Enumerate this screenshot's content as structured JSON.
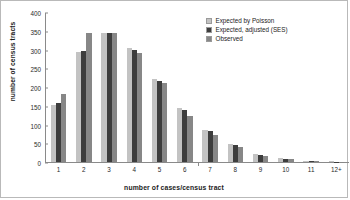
{
  "chart_data": {
    "type": "bar",
    "title": "",
    "xlabel": "number of cases/census tract",
    "ylabel": "number of census tracts",
    "categories": [
      "1",
      "2",
      "3",
      "4",
      "5",
      "6",
      "7",
      "8",
      "9",
      "10",
      "11",
      "12+"
    ],
    "ylim": [
      0,
      400
    ],
    "yticks": [
      0,
      50,
      100,
      150,
      200,
      250,
      300,
      350,
      400
    ],
    "grid": false,
    "legend_position": "top-right",
    "series": [
      {
        "name": "Expected by Poisson",
        "color": "#c3c3c3",
        "values": [
          153,
          293,
          344,
          305,
          222,
          145,
          85,
          47,
          22,
          10,
          4,
          2
        ]
      },
      {
        "name": "Expected, adjusted (SES)",
        "color": "#3d3d3d",
        "values": [
          158,
          297,
          344,
          300,
          217,
          140,
          83,
          46,
          20,
          9,
          3,
          1
        ]
      },
      {
        "name": "Observed",
        "color": "#878787",
        "values": [
          182,
          343,
          343,
          290,
          210,
          122,
          72,
          39,
          16,
          7,
          3,
          1
        ]
      }
    ]
  },
  "figure": {
    "frame_color": "#b9b9b9",
    "axis_color": "#8a8a8a",
    "background": "#ffffff"
  }
}
